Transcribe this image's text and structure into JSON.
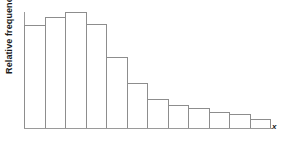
{
  "figure": {
    "kind": "relative-frequency-histogram",
    "background_color": "#ffffff",
    "bar_fill_color": "#ffffff",
    "bar_outline_color": "#8d8d8d",
    "axis_color": "#9a9a9a",
    "text_color": "#1a1a1a"
  },
  "axes": {
    "y_title": "Relative frequency",
    "x_title": "x"
  },
  "chart_data": {
    "type": "bar",
    "title": "",
    "subtitle": "",
    "xlabel": "x",
    "ylabel": "Relative frequency",
    "grid": false,
    "legend": false,
    "legend_position": "none",
    "xlim": [
      0,
      12
    ],
    "ylim": [
      0,
      1
    ],
    "tick_labels": {
      "x": [],
      "y": []
    },
    "annotations": [],
    "shape_description": "right-skewed (positively skewed) unimodal distribution with a long tail to the right",
    "bin_count": 12,
    "categories": [
      "1",
      "2",
      "3",
      "4",
      "5",
      "6",
      "7",
      "8",
      "9",
      "10",
      "11",
      "12"
    ],
    "values": [
      0.89,
      0.96,
      1.0,
      0.9,
      0.61,
      0.39,
      0.25,
      0.2,
      0.17,
      0.14,
      0.12,
      0.08
    ],
    "series": [
      {
        "name": "Relative frequency",
        "values": [
          0.89,
          0.96,
          1.0,
          0.9,
          0.61,
          0.39,
          0.25,
          0.2,
          0.17,
          0.14,
          0.12,
          0.08
        ]
      }
    ]
  }
}
